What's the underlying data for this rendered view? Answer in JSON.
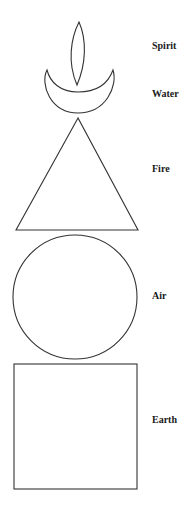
{
  "diagram": {
    "elements": [
      {
        "key": "spirit",
        "label": "Spirit",
        "shape": "leaf"
      },
      {
        "key": "water",
        "label": "Water",
        "shape": "crescent"
      },
      {
        "key": "fire",
        "label": "Fire",
        "shape": "triangle"
      },
      {
        "key": "air",
        "label": "Air",
        "shape": "circle"
      },
      {
        "key": "earth",
        "label": "Earth",
        "shape": "square"
      }
    ],
    "colors": {
      "stroke": "#333333",
      "text": "#1a1a1a",
      "background": "#ffffff"
    }
  }
}
